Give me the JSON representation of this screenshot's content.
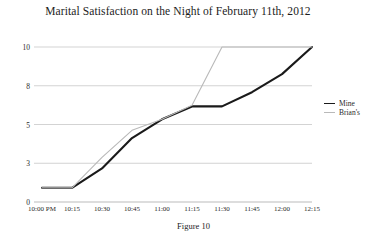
{
  "figure": {
    "caption": "Figure 10"
  },
  "chart_data": {
    "type": "line",
    "title": "Marital Satisfaction on the Night of February 11th, 2012",
    "xlabel": "",
    "ylabel": "",
    "x": [
      "10:00 PM",
      "10:15",
      "10:30",
      "10:45",
      "11:00",
      "11:15",
      "11:30",
      "11:45",
      "12:00",
      "12:15"
    ],
    "ytick_labels": [
      "10",
      "8",
      "5",
      "3",
      "0"
    ],
    "ytick_values": [
      10,
      8,
      5,
      3,
      0
    ],
    "ylim": [
      0,
      10
    ],
    "grid": true,
    "legend_position": "right",
    "series": [
      {
        "name": "Mine",
        "color": "#1a1a1a",
        "width": 2.1,
        "values": [
          1.1,
          1.1,
          2.6,
          4.3,
          5.4,
          6.4,
          6.4,
          7.5,
          8.6,
          10
        ]
      },
      {
        "name": "Brian's",
        "color": "#b9b9b9",
        "width": 1.1,
        "values": [
          1.1,
          1.1,
          3.3,
          4.7,
          5.4,
          6.5,
          10,
          10,
          10,
          10
        ]
      }
    ]
  }
}
